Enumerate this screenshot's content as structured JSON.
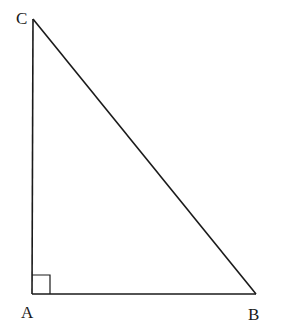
{
  "diagram": {
    "type": "right-triangle",
    "vertices": {
      "A": {
        "label": "A",
        "x": 32,
        "y": 294
      },
      "B": {
        "label": "B",
        "x": 256,
        "y": 294
      },
      "C": {
        "label": "C",
        "x": 33,
        "y": 19
      }
    },
    "right_angle_at": "A",
    "stroke_color": "#1a1a1a"
  }
}
